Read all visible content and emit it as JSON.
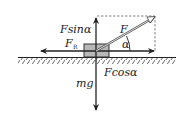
{
  "diagram": {
    "labels": {
      "f_sin": "Fsinα",
      "f": "F",
      "f_r_main": "F",
      "f_r_sub": "R",
      "alpha": "α",
      "mg": "mg",
      "f_cos": "Fcosα"
    },
    "colors": {
      "line": "#222222",
      "block_fill": "#b8b8b8",
      "block_stroke": "#333333",
      "dashed": "#555555"
    }
  }
}
